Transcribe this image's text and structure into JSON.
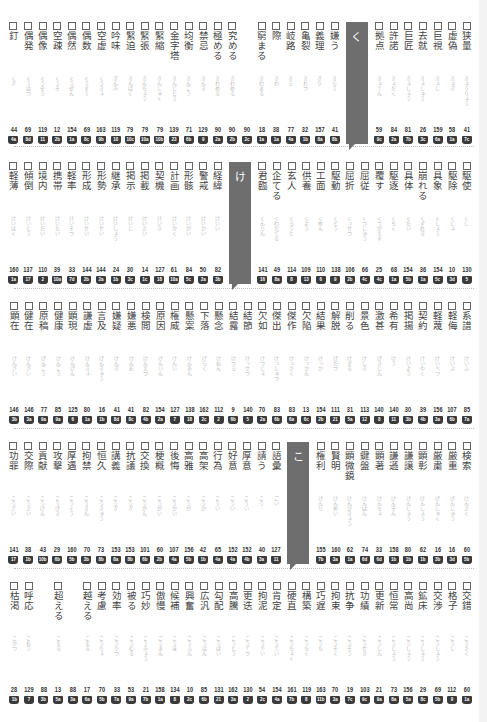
{
  "rows": [
    {
      "tab_label": "く",
      "tab_position": 7,
      "entries": [
        {
          "word": "狭量",
          "reading": "きょうりょう",
          "num": "41",
          "badge": "7c"
        },
        {
          "word": "虚偽",
          "reading": "きょぎ",
          "num": "58",
          "badge": "1a"
        },
        {
          "word": "巨視",
          "reading": "きょし",
          "num": "159",
          "badge": "6a"
        },
        {
          "word": "去就",
          "reading": "きょしゅう",
          "num": "26",
          "badge": "3c"
        },
        {
          "word": "巨匠",
          "reading": "きょしょう",
          "num": "81",
          "badge": "7b"
        },
        {
          "word": "許諾",
          "reading": "きょだく",
          "num": "84",
          "badge": "2a"
        },
        {
          "word": "拠点",
          "reading": "きょてん",
          "num": "59",
          "badge": "9c"
        },
        {
          "word": "嫌う",
          "reading": "きらう",
          "num": "41",
          "badge": "8b"
        },
        {
          "word": "義理",
          "reading": "ぎり",
          "num": "157",
          "badge": "8a"
        },
        {
          "word": "亀裂",
          "reading": "きれつ",
          "num": "32",
          "badge": "1b"
        },
        {
          "word": "岐路",
          "reading": "きろ",
          "num": "77",
          "badge": "4a"
        },
        {
          "word": "際",
          "reading": "きわ",
          "num": "38",
          "badge": "1a"
        },
        {
          "word": "窮まる",
          "reading": "きわまる",
          "num": "18",
          "badge": "1a"
        },
        {
          "word": "",
          "reading": "",
          "num": "90",
          "badge": "2c"
        },
        {
          "word": "究める",
          "reading": "きわめる",
          "num": "90",
          "badge": "2b"
        },
        {
          "word": "極める",
          "reading": "きわめる",
          "num": "90",
          "badge": "2a"
        },
        {
          "word": "禁忌",
          "reading": "きんき",
          "num": "129",
          "badge": "9"
        },
        {
          "word": "均衡",
          "reading": "きんこう",
          "num": "71",
          "badge": "6b"
        },
        {
          "word": "金字塔",
          "reading": "きんじとう",
          "num": "139",
          "badge": "23"
        },
        {
          "word": "緊縮",
          "reading": "きんしゅく",
          "num": "79",
          "badge": "10b"
        },
        {
          "word": "緊張",
          "reading": "きんちょう",
          "num": "79",
          "badge": "10a"
        },
        {
          "word": "緊迫",
          "reading": "きんぱく",
          "num": "79",
          "badge": "10c"
        },
        {
          "word": "吟味",
          "reading": "ぎんみ",
          "num": "119",
          "badge": "10"
        },
        {
          "word": "空虚",
          "reading": "くうきょ",
          "num": "163",
          "badge": "9b"
        },
        {
          "word": "偶数",
          "reading": "ぐうすう",
          "num": "69",
          "badge": "8c"
        },
        {
          "word": "偶然",
          "reading": "ぐうぜん",
          "num": "154",
          "badge": "1a"
        },
        {
          "word": "空疎",
          "reading": "くうそ",
          "num": "12",
          "badge": "2b"
        },
        {
          "word": "偶像",
          "reading": "ぐうぞう",
          "num": "119",
          "badge": "11"
        },
        {
          "word": "偶発",
          "reading": "ぐうはつ",
          "num": "69",
          "badge": "8d"
        },
        {
          "word": "釘",
          "reading": "くぎ",
          "num": "44",
          "badge": "4a"
        }
      ]
    },
    {
      "tab_label": "け",
      "tab_position": 15,
      "entries": [
        {
          "word": "駆使",
          "reading": "くし",
          "num": "130",
          "badge": "5"
        },
        {
          "word": "駆除",
          "reading": "くじょ",
          "num": "10",
          "badge": "3d"
        },
        {
          "word": "具象",
          "reading": "ぐしょう",
          "num": "154",
          "badge": "5c"
        },
        {
          "word": "崩れる",
          "reading": "くずれる",
          "num": "36",
          "badge": "1a"
        },
        {
          "word": "具体",
          "reading": "ぐたい",
          "num": "154",
          "badge": "5b"
        },
        {
          "word": "駆逐",
          "reading": "くちく",
          "num": "68",
          "badge": "1a"
        },
        {
          "word": "覆す",
          "reading": "くつがえす",
          "num": "25",
          "badge": "4c"
        },
        {
          "word": "屈従",
          "reading": "くつじゅう",
          "num": "66",
          "badge": "4c"
        },
        {
          "word": "屈折",
          "reading": "くっせつ",
          "num": "106",
          "badge": "2b"
        },
        {
          "word": "駆動",
          "reading": "くどう",
          "num": "138",
          "badge": "9"
        },
        {
          "word": "工面",
          "reading": "くめん",
          "num": "110",
          "badge": "6"
        },
        {
          "word": "供養",
          "reading": "くよう",
          "num": "109",
          "badge": "13"
        },
        {
          "word": "玄人",
          "reading": "くろうと",
          "num": "114",
          "badge": "8"
        },
        {
          "word": "企てる",
          "reading": "くわだてる",
          "num": "49",
          "badge": "8a"
        },
        {
          "word": "君臨",
          "reading": "くんりん",
          "num": "141",
          "badge": "16"
        },
        {
          "word": "経緯",
          "reading": "けいい",
          "num": "82",
          "badge": "3b"
        },
        {
          "word": "警戒",
          "reading": "けいかい",
          "num": "50",
          "badge": "2a"
        },
        {
          "word": "形骸",
          "reading": "けいがい",
          "num": "84",
          "badge": "5c"
        },
        {
          "word": "計画",
          "reading": "けいかく",
          "num": "61",
          "badge": "10a"
        },
        {
          "word": "契機",
          "reading": "けいき",
          "num": "127",
          "badge": "18"
        },
        {
          "word": "掲載",
          "reading": "けいさい",
          "num": "14",
          "badge": "1c"
        },
        {
          "word": "掲示",
          "reading": "けいじ",
          "num": "30",
          "badge": "3c"
        },
        {
          "word": "継承",
          "reading": "けいしょう",
          "num": "24",
          "badge": "1b"
        },
        {
          "word": "形勢",
          "reading": "けいせい",
          "num": "144",
          "badge": "2a"
        },
        {
          "word": "形成",
          "reading": "けいせい",
          "num": "144",
          "badge": "2b"
        },
        {
          "word": "軽率",
          "reading": "けいそつ",
          "num": "33",
          "badge": "7d"
        },
        {
          "word": "携帯",
          "reading": "けいたい",
          "num": "39",
          "badge": "10a"
        },
        {
          "word": "境内",
          "reading": "けいだい",
          "num": "110",
          "badge": "2"
        },
        {
          "word": "傾倒",
          "reading": "けいとう",
          "num": "137",
          "badge": "17"
        },
        {
          "word": "軽薄",
          "reading": "けいはく",
          "num": "160",
          "badge": "1a"
        }
      ]
    },
    {
      "tab_label": "",
      "tab_position": -1,
      "entries": [
        {
          "word": "系譜",
          "reading": "けいふ",
          "num": "85",
          "badge": "7a"
        },
        {
          "word": "軽侮",
          "reading": "けいぶ",
          "num": "107",
          "badge": "6b"
        },
        {
          "word": "軽蔑",
          "reading": "けいべつ",
          "num": "156",
          "badge": "3a"
        },
        {
          "word": "契約",
          "reading": "けいやく",
          "num": "39",
          "badge": "4b"
        },
        {
          "word": "掲揚",
          "reading": "けいよう",
          "num": "30",
          "badge": "3b"
        },
        {
          "word": "希有",
          "reading": "けう",
          "num": "140",
          "badge": "11"
        },
        {
          "word": "激甚",
          "reading": "げきじん",
          "num": "140",
          "badge": "8"
        },
        {
          "word": "景色",
          "reading": "けしき",
          "num": "113",
          "badge": "12"
        },
        {
          "word": "削る",
          "reading": "けずる",
          "num": "31",
          "badge": "5a"
        },
        {
          "word": "解脱",
          "reading": "げだつ",
          "num": "111",
          "badge": "21"
        },
        {
          "word": "結果",
          "reading": "けっか",
          "num": "154",
          "badge": "2b"
        },
        {
          "word": "欠陥",
          "reading": "けっかん",
          "num": "13",
          "badge": "6c"
        },
        {
          "word": "傑作",
          "reading": "けっさく",
          "num": "83",
          "badge": "6a"
        },
        {
          "word": "傑出",
          "reading": "けっしゅつ",
          "num": "83",
          "badge": "6b"
        },
        {
          "word": "欠如",
          "reading": "けつじょ",
          "num": "70",
          "badge": "2a"
        },
        {
          "word": "結節",
          "reading": "けっせつ",
          "num": "140",
          "badge": "5"
        },
        {
          "word": "結露",
          "reading": "けつろ",
          "num": "9",
          "badge": "6b"
        },
        {
          "word": "懸念",
          "reading": "けねん",
          "num": "112",
          "badge": "2"
        },
        {
          "word": "下落",
          "reading": "げらく",
          "num": "162",
          "badge": "2c"
        },
        {
          "word": "懸案",
          "reading": "けんあん",
          "num": "138",
          "badge": "18"
        },
        {
          "word": "権威",
          "reading": "けんい",
          "num": "127",
          "badge": "7"
        },
        {
          "word": "原因",
          "reading": "げんいん",
          "num": "154",
          "badge": "2a"
        },
        {
          "word": "検閲",
          "reading": "けんえつ",
          "num": "82",
          "badge": "4b"
        },
        {
          "word": "嫌悪",
          "reading": "けんお",
          "num": "41",
          "badge": "8c"
        },
        {
          "word": "嫌疑",
          "reading": "けんぎ",
          "num": "41",
          "badge": "8d"
        },
        {
          "word": "言及",
          "reading": "げんきゅう",
          "num": "16",
          "badge": "1b"
        },
        {
          "word": "謙虚",
          "reading": "けんきょ",
          "num": "80",
          "badge": "1a"
        },
        {
          "word": "顕現",
          "reading": "けんげん",
          "num": "125",
          "badge": "6"
        },
        {
          "word": "健康",
          "reading": "けんこう",
          "num": "85",
          "badge": "9a"
        },
        {
          "word": "原稿",
          "reading": "げんこう",
          "num": "77",
          "badge": "9a"
        },
        {
          "word": "健在",
          "reading": "けんざい",
          "num": "146",
          "badge": "3a"
        },
        {
          "word": "顕在",
          "reading": "けんざい",
          "num": "146",
          "badge": "3b"
        }
      ]
    },
    {
      "tab_label": "こ",
      "tab_position": 11,
      "entries": [
        {
          "word": "検索",
          "reading": "けんさく",
          "num": "60",
          "badge": "5b"
        },
        {
          "word": "厳重",
          "reading": "げんじゅう",
          "num": "16",
          "badge": "3d"
        },
        {
          "word": "厳粛",
          "reading": "げんしゅく",
          "num": "16",
          "badge": "3b"
        },
        {
          "word": "顕彰",
          "reading": "けんしょう",
          "num": "62",
          "badge": "1b"
        },
        {
          "word": "謙譲",
          "reading": "けんじょう",
          "num": "80",
          "badge": "1b"
        },
        {
          "word": "謙遜",
          "reading": "けんそん",
          "num": "158",
          "badge": "1b"
        },
        {
          "word": "顕著",
          "reading": "けんちょ",
          "num": "33",
          "badge": "6d"
        },
        {
          "word": "鍵盤",
          "reading": "けんばん",
          "num": "74",
          "badge": "6d"
        },
        {
          "word": "顕微鏡",
          "reading": "けんびきょう",
          "num": "62",
          "badge": "1a"
        },
        {
          "word": "賢明",
          "reading": "けんめい",
          "num": "160",
          "badge": "3a"
        },
        {
          "word": "権利",
          "reading": "けんり",
          "num": "155",
          "badge": "7b"
        },
        {
          "word": "語彙",
          "reading": "ごい",
          "num": "127",
          "badge": "11"
        },
        {
          "word": "請う",
          "reading": "こう",
          "num": "40",
          "badge": "3a"
        },
        {
          "word": "厚意",
          "reading": "こうい",
          "num": "152",
          "badge": "4b"
        },
        {
          "word": "好意",
          "reading": "こうい",
          "num": "152",
          "badge": "4a"
        },
        {
          "word": "行為",
          "reading": "こうい",
          "num": "65",
          "badge": "4a"
        },
        {
          "word": "高架",
          "reading": "こうか",
          "num": "42",
          "badge": "1b"
        },
        {
          "word": "高雅",
          "reading": "こうが",
          "num": "156",
          "badge": "5b"
        },
        {
          "word": "後悔",
          "reading": "こうかい",
          "num": "107",
          "badge": "4a"
        },
        {
          "word": "梗概",
          "reading": "こうがい",
          "num": "60",
          "badge": "2b"
        },
        {
          "word": "交換",
          "reading": "こうかん",
          "num": "101",
          "badge": "6b"
        },
        {
          "word": "抗議",
          "reading": "こうぎ",
          "num": "153",
          "badge": "8b"
        },
        {
          "word": "講義",
          "reading": "こうぎ",
          "num": "153",
          "badge": "8a"
        },
        {
          "word": "恒久",
          "reading": "こうきゅう",
          "num": "73",
          "badge": "8b"
        },
        {
          "word": "拘禁",
          "reading": "こうきん",
          "num": "70",
          "badge": "3b"
        },
        {
          "word": "厚遇",
          "reading": "こうぐう",
          "num": "160",
          "badge": "5b"
        },
        {
          "word": "攻撃",
          "reading": "こうげき",
          "num": "29",
          "badge": "6b"
        },
        {
          "word": "貢献",
          "reading": "こうけん",
          "num": "43",
          "badge": "10b"
        },
        {
          "word": "交際",
          "reading": "こうさい",
          "num": "38",
          "badge": "1b"
        },
        {
          "word": "功罪",
          "reading": "こうざい",
          "num": "141",
          "badge": "17"
        }
      ]
    },
    {
      "tab_label": "",
      "tab_position": -1,
      "entries": [
        {
          "word": "交錯",
          "reading": "こうさく",
          "num": "60",
          "badge": "1a"
        },
        {
          "word": "格子",
          "reading": "こうし",
          "num": "112",
          "badge": "9"
        },
        {
          "word": "交渉",
          "reading": "こうしょう",
          "num": "69",
          "badge": "5b"
        },
        {
          "word": "鉱床",
          "reading": "こうしょう",
          "num": "29",
          "badge": "8c"
        },
        {
          "word": "高尚",
          "reading": "こうしょう",
          "num": "156",
          "badge": "5a"
        },
        {
          "word": "恒常",
          "reading": "こうじょう",
          "num": "73",
          "badge": "8a"
        },
        {
          "word": "更新",
          "reading": "こうしん",
          "num": "21",
          "badge": "9a"
        },
        {
          "word": "功績",
          "reading": "こうせき",
          "num": "103",
          "badge": "9c"
        },
        {
          "word": "抗争",
          "reading": "こうそう",
          "num": "19",
          "badge": "7c"
        },
        {
          "word": "拘束",
          "reading": "こうそく",
          "num": "70",
          "badge": "3a"
        },
        {
          "word": "巧遅",
          "reading": "こうち",
          "num": "163",
          "badge": "11b"
        },
        {
          "word": "構築",
          "reading": "こうちく",
          "num": "119",
          "badge": "8"
        },
        {
          "word": "硬直",
          "reading": "こうちょく",
          "num": "161",
          "badge": "7b"
        },
        {
          "word": "肯定",
          "reading": "こうてい",
          "num": "154",
          "badge": "4a"
        },
        {
          "word": "拘泥",
          "reading": "こうでい",
          "num": "54",
          "badge": "2c"
        },
        {
          "word": "更迭",
          "reading": "こうてつ",
          "num": "130",
          "badge": "2"
        },
        {
          "word": "高騰",
          "reading": "こうとう",
          "num": "162",
          "badge": "3a"
        },
        {
          "word": "勾配",
          "reading": "こうばい",
          "num": "131",
          "badge": "21"
        },
        {
          "word": "広汎",
          "reading": "こうはん",
          "num": "85",
          "badge": "6b"
        },
        {
          "word": "興奮",
          "reading": "こうふん",
          "num": "10",
          "badge": "2c"
        },
        {
          "word": "候補",
          "reading": "こうほ",
          "num": "134",
          "badge": "8"
        },
        {
          "word": "傲慢",
          "reading": "ごうまん",
          "num": "158",
          "badge": "1a"
        },
        {
          "word": "巧妙",
          "reading": "こうみょう",
          "num": "21",
          "badge": "7b"
        },
        {
          "word": "被る",
          "reading": "こうむる",
          "num": "53",
          "badge": "9a"
        },
        {
          "word": "効率",
          "reading": "こうりつ",
          "num": "33",
          "badge": "7a"
        },
        {
          "word": "考慮",
          "reading": "こうりょ",
          "num": "70",
          "badge": "5b"
        },
        {
          "word": "越える",
          "reading": "こえる",
          "num": "17",
          "badge": "6a"
        },
        {
          "word": "",
          "reading": "",
          "num": "88",
          "badge": "3a"
        },
        {
          "word": "超える",
          "reading": "こえる",
          "num": "13",
          "badge": "5a"
        },
        {
          "word": "",
          "reading": "",
          "num": "88",
          "badge": "3b"
        },
        {
          "word": "呼応",
          "reading": "こおう",
          "num": "129",
          "badge": "7"
        },
        {
          "word": "枯渇",
          "reading": "こかつ",
          "num": "28",
          "badge": "1b"
        }
      ]
    }
  ]
}
